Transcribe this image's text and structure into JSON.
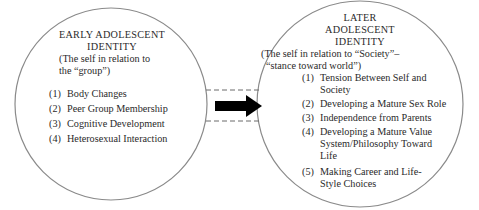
{
  "left_circle": {
    "title_line1": "EARLY ADOLESCENT",
    "title_line2": "IDENTITY",
    "subtitle_line1": "(The self in relation to",
    "subtitle_line2": "the “group”)",
    "items": [
      {
        "num": "(1)",
        "lines": [
          "Body Changes"
        ]
      },
      {
        "num": "(2)",
        "lines": [
          "Peer Group Membership"
        ]
      },
      {
        "num": "(3)",
        "lines": [
          "Cognitive Development"
        ]
      },
      {
        "num": "(4)",
        "lines": [
          "Heterosexual Interaction"
        ]
      }
    ]
  },
  "right_circle": {
    "title_line1": "LATER",
    "title_line2": "ADOLESCENT",
    "title_line3": "IDENTITY",
    "subtitle_line1": "(The self in relation to “Society”–",
    "subtitle_line2": "“stance toward world”)",
    "items": [
      {
        "num": "(1)",
        "lines": [
          "Tension Between Self and",
          "Society"
        ]
      },
      {
        "num": "(2)",
        "lines": [
          "Developing a Mature Sex Role"
        ]
      },
      {
        "num": "(3)",
        "lines": [
          "Independence from Parents"
        ]
      },
      {
        "num": "(4)",
        "lines": [
          "Developing a Mature Value",
          "System/Philosophy Toward",
          "Life"
        ]
      },
      {
        "num": "(5)",
        "lines": [
          "Making Career and Life-",
          "Style Choices"
        ]
      }
    ]
  },
  "connector": {
    "arrow_icon": "right-arrow-icon",
    "style": "dashed-channel"
  },
  "colors": {
    "circle_stroke": "#8a8a8a",
    "text": "#2a2a2a",
    "arrow": "#000000",
    "dash": "#6a6a6a"
  }
}
